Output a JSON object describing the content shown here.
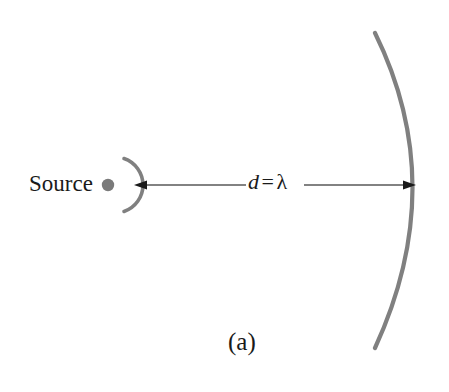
{
  "figure": {
    "caption": "(a)",
    "background_color": "#ffffff",
    "width": 449,
    "height": 392
  },
  "source": {
    "label": "Source",
    "dot_color": "#7a7a7a",
    "dot_center": {
      "x": 108,
      "y": 185
    },
    "dot_radius": 6
  },
  "wavefronts": {
    "color": "#808080",
    "stroke_width": 4,
    "near": {
      "name": "near-wavefront-arc",
      "center": {
        "x": 108,
        "y": 185
      },
      "radius": 28,
      "start": {
        "x": 124,
        "y": 159
      },
      "end": {
        "x": 124,
        "y": 211
      },
      "bulge_x": 136
    },
    "far": {
      "name": "far-wavefront-arc",
      "top": {
        "x": 375,
        "y": 33
      },
      "bottom": {
        "x": 375,
        "y": 348
      },
      "apex": {
        "x": 417,
        "y": 185
      }
    }
  },
  "dimension": {
    "label_d": "d",
    "label_equals": "=",
    "label_lambda": "λ",
    "full_label": "d = λ",
    "line_color": "#4d4d4d",
    "arrow_color": "#1a1a1a",
    "left_tip": {
      "x": 134,
      "y": 185
    },
    "right_tip": {
      "x": 416,
      "y": 185
    },
    "gap_start_x": 246,
    "gap_end_x": 304
  }
}
